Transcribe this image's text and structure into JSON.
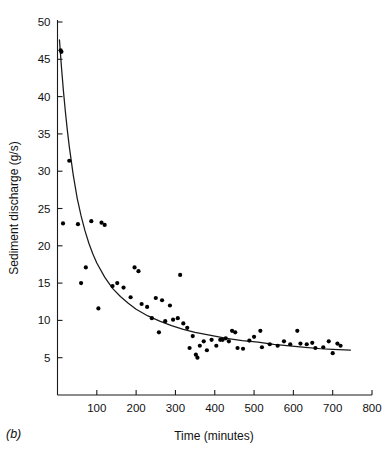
{
  "figure": {
    "panel_label": "(b)",
    "background": "#ffffff",
    "ink_color": "#1a1a1a"
  },
  "chart_data": {
    "type": "scatter",
    "title": "",
    "xlabel": "Time (minutes)",
    "ylabel": "Sediment discharge (g/s)",
    "xlim": [
      0,
      800
    ],
    "ylim": [
      0,
      50
    ],
    "xticks": [
      100,
      200,
      300,
      400,
      500,
      600,
      700,
      800
    ],
    "xticklabels": [
      "100",
      "200",
      "300",
      "400",
      "500",
      "600",
      "700",
      "800"
    ],
    "yticks": [
      5,
      10,
      15,
      20,
      25,
      30,
      35,
      40,
      45,
      50
    ],
    "yticklabels": [
      "5",
      "10",
      "15",
      "20",
      "25",
      "30",
      "35",
      "40",
      "45",
      "50"
    ],
    "grid": false,
    "legend": null,
    "marker": "filled-circle",
    "marker_color": "#000000",
    "series": [
      {
        "name": "Sediment discharge observations",
        "points": [
          [
            8,
            46.2
          ],
          [
            10,
            46.0
          ],
          [
            14,
            23.0
          ],
          [
            30,
            31.4
          ],
          [
            52,
            22.9
          ],
          [
            60,
            15.0
          ],
          [
            72,
            17.1
          ],
          [
            86,
            23.3
          ],
          [
            104,
            11.6
          ],
          [
            112,
            23.1
          ],
          [
            120,
            22.8
          ],
          [
            140,
            14.6
          ],
          [
            152,
            15.0
          ],
          [
            168,
            14.4
          ],
          [
            186,
            13.1
          ],
          [
            196,
            17.1
          ],
          [
            206,
            16.6
          ],
          [
            214,
            12.2
          ],
          [
            228,
            11.8
          ],
          [
            240,
            10.3
          ],
          [
            250,
            13.0
          ],
          [
            258,
            8.4
          ],
          [
            266,
            12.7
          ],
          [
            274,
            9.9
          ],
          [
            286,
            12.0
          ],
          [
            294,
            10.1
          ],
          [
            306,
            10.3
          ],
          [
            312,
            16.1
          ],
          [
            320,
            9.6
          ],
          [
            330,
            9.0
          ],
          [
            336,
            6.3
          ],
          [
            344,
            7.9
          ],
          [
            352,
            5.4
          ],
          [
            356,
            5.0
          ],
          [
            362,
            6.6
          ],
          [
            372,
            7.2
          ],
          [
            380,
            6.0
          ],
          [
            392,
            7.4
          ],
          [
            404,
            6.6
          ],
          [
            414,
            7.4
          ],
          [
            420,
            7.4
          ],
          [
            428,
            7.6
          ],
          [
            436,
            7.2
          ],
          [
            444,
            8.6
          ],
          [
            452,
            8.4
          ],
          [
            458,
            6.3
          ],
          [
            472,
            6.2
          ],
          [
            488,
            7.3
          ],
          [
            500,
            7.8
          ],
          [
            516,
            8.6
          ],
          [
            520,
            6.4
          ],
          [
            540,
            6.8
          ],
          [
            560,
            6.6
          ],
          [
            576,
            7.2
          ],
          [
            592,
            6.8
          ],
          [
            610,
            8.6
          ],
          [
            618,
            6.9
          ],
          [
            634,
            6.8
          ],
          [
            648,
            7.0
          ],
          [
            656,
            6.3
          ],
          [
            676,
            6.4
          ],
          [
            690,
            7.2
          ],
          [
            700,
            5.6
          ],
          [
            712,
            6.9
          ],
          [
            720,
            6.6
          ]
        ]
      }
    ],
    "fit_curve": {
      "name": "Fitted decay curve",
      "description": "Exponential-type decay fitted through the observations",
      "points": [
        [
          5,
          47.6
        ],
        [
          10,
          44.0
        ],
        [
          15,
          40.8
        ],
        [
          20,
          38.0
        ],
        [
          25,
          35.5
        ],
        [
          30,
          33.3
        ],
        [
          40,
          29.5
        ],
        [
          50,
          26.4
        ],
        [
          60,
          24.0
        ],
        [
          70,
          22.0
        ],
        [
          80,
          20.3
        ],
        [
          90,
          18.9
        ],
        [
          100,
          17.7
        ],
        [
          120,
          15.8
        ],
        [
          140,
          14.3
        ],
        [
          160,
          13.2
        ],
        [
          180,
          12.3
        ],
        [
          200,
          11.5
        ],
        [
          230,
          10.6
        ],
        [
          260,
          9.9
        ],
        [
          290,
          9.3
        ],
        [
          320,
          8.8
        ],
        [
          350,
          8.4
        ],
        [
          390,
          8.0
        ],
        [
          430,
          7.6
        ],
        [
          470,
          7.3
        ],
        [
          510,
          7.1
        ],
        [
          550,
          6.8
        ],
        [
          590,
          6.6
        ],
        [
          630,
          6.4
        ],
        [
          670,
          6.2
        ],
        [
          700,
          6.1
        ],
        [
          745,
          6.0
        ]
      ]
    }
  }
}
